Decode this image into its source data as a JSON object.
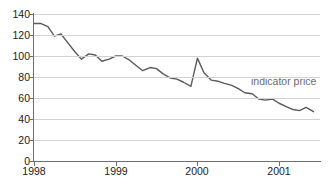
{
  "chart_data": {
    "type": "line",
    "title": "",
    "xlabel": "",
    "ylabel": "",
    "grid": true,
    "legend_position": "inline-right",
    "ylim": [
      0,
      140
    ],
    "xlim": [
      1998.0,
      2001.5
    ],
    "y_ticks": [
      0,
      20,
      40,
      60,
      80,
      100,
      120,
      140
    ],
    "x_ticks": [
      1998,
      1999,
      2000,
      2001
    ],
    "x_tick_labels": [
      "1998",
      "1999",
      "2000",
      "2001"
    ],
    "annotations": [
      {
        "text": "indicator price",
        "x": 2000.95,
        "y": 72
      }
    ],
    "series": [
      {
        "name": "indicator price",
        "color": "#5a5a5a",
        "x": [
          1998.0,
          1998.08,
          1998.17,
          1998.25,
          1998.33,
          1998.42,
          1998.5,
          1998.58,
          1998.67,
          1998.75,
          1998.83,
          1998.92,
          1999.0,
          1999.08,
          1999.17,
          1999.25,
          1999.33,
          1999.42,
          1999.5,
          1999.58,
          1999.67,
          1999.75,
          1999.83,
          1999.92,
          2000.0,
          2000.08,
          2000.17,
          2000.25,
          2000.33,
          2000.42,
          2000.5,
          2000.58,
          2000.67,
          2000.75,
          2000.83,
          2000.92,
          2001.0,
          2001.08,
          2001.17,
          2001.25,
          2001.33,
          2001.42
        ],
        "values": [
          131,
          131,
          128,
          119,
          121,
          112,
          104,
          97,
          102,
          101,
          95,
          97,
          100,
          100,
          96,
          91,
          86,
          89,
          88,
          83,
          79,
          78,
          75,
          71,
          98,
          84,
          77,
          76,
          74,
          72,
          69,
          65,
          64,
          59,
          58,
          59,
          55,
          52,
          49,
          48,
          51,
          47
        ]
      }
    ]
  },
  "axis": {
    "y_tick_labels": [
      "140",
      "120",
      "100",
      "80",
      "60",
      "40",
      "20",
      "0"
    ],
    "x_tick_labels": [
      "1998",
      "1999",
      "2000",
      "2001"
    ]
  },
  "annotation": {
    "indicator_price_label": "indicator price"
  },
  "colors": {
    "line": "#5a5a5a",
    "grid": "#d2d2d2",
    "axis": "#6e6e6e",
    "tick_text": "#1a1a1a",
    "annotation_text": "#6b6b6b",
    "background": "#ffffff"
  }
}
